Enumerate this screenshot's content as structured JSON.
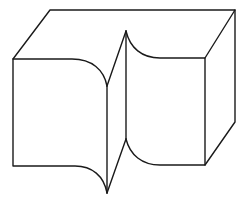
{
  "diagram": {
    "title": "",
    "stroke_color": "#1a1a1a",
    "background": "#ffffff"
  }
}
